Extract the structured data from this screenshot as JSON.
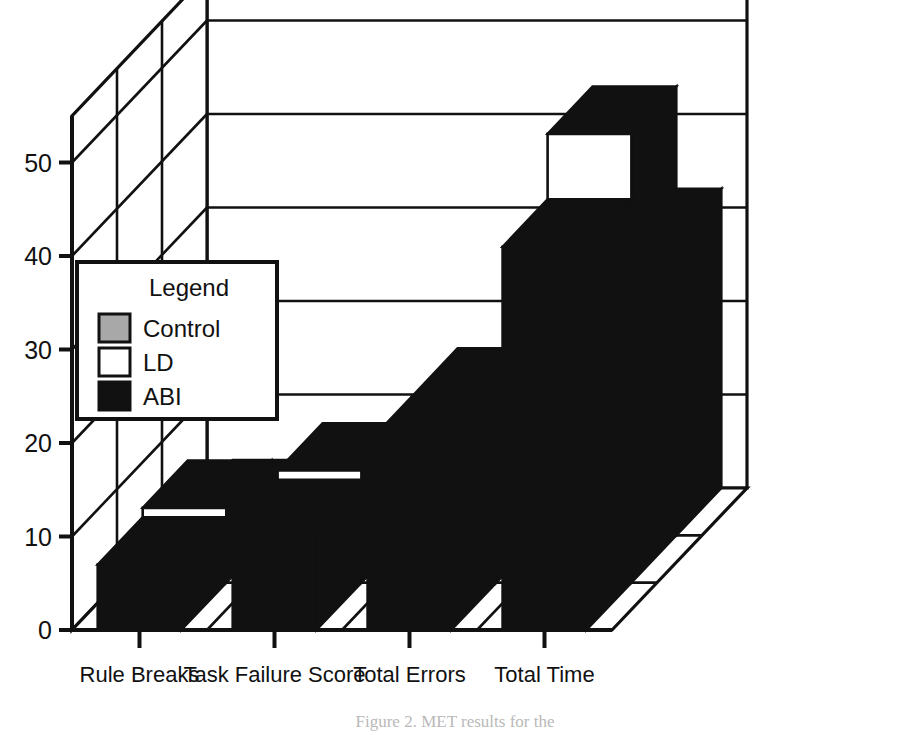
{
  "chart_data": {
    "type": "bar",
    "subtype": "3d-grouped-bar",
    "title": "",
    "xlabel": "",
    "ylabel": "",
    "ylim": [
      0,
      55
    ],
    "yticks": [
      0,
      10,
      20,
      30,
      40,
      50
    ],
    "ytick_labels": [
      "0",
      "10",
      "20",
      "30",
      "40",
      "50"
    ],
    "grid": true,
    "grid_orientation": "horizontal",
    "categories": [
      "Rule Breaks",
      "Task Failure Score",
      "Total Errors",
      "Total  Time"
    ],
    "legend_title": "Legend",
    "legend_position": "left-middle",
    "series": [
      {
        "name": "Control",
        "color": "#a8a8a8",
        "depth_index": 2,
        "values": [
          3,
          4,
          9,
          32
        ]
      },
      {
        "name": "LD",
        "color": "#ffffff",
        "depth_index": 1,
        "values": [
          8,
          12,
          20,
          48
        ]
      },
      {
        "name": "ABI",
        "color": "#111111",
        "depth_index": 0,
        "values": [
          7,
          11,
          20,
          41
        ]
      }
    ]
  },
  "axis": {
    "y_tick_labels": [
      "50",
      "40",
      "30",
      "20",
      "10",
      "0"
    ],
    "x_tick_labels": [
      "Rule Breaks",
      "Task Failure Score",
      "Total Errors",
      "Total  Time"
    ]
  },
  "legend": {
    "title": "Legend",
    "entries": [
      {
        "label": "Control",
        "swatch": "#a8a8a8"
      },
      {
        "label": "LD",
        "swatch": "#ffffff"
      },
      {
        "label": "ABI",
        "swatch": "#111111"
      }
    ]
  },
  "caption": {
    "text": "Figure 2.  MET results for the"
  },
  "colors": {
    "ink": "#111111",
    "gray": "#a8a8a8",
    "white": "#ffffff",
    "paper": "#ffffff"
  }
}
